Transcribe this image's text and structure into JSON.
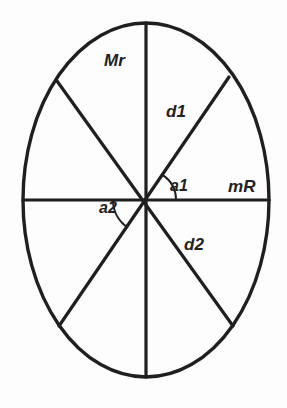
{
  "figure": {
    "background_color": "#fdfdfd",
    "stroke_color": "#1f1f1f",
    "label_color": "#222222"
  },
  "ellipse": {
    "center_x": 146,
    "center_y": 200,
    "radius_x": 123,
    "radius_y": 177,
    "stroke_width": 3
  },
  "labels": {
    "major_radius_vertical": "Mr",
    "diagonal_upper_right": "d1",
    "minor_radius_horizontal": "mR",
    "angle_upper": "a1",
    "angle_lower": "a2",
    "diagonal_lower_right": "d2"
  },
  "chart_data": {
    "type": "diagram",
    "shape": "ellipse",
    "center": [
      146,
      200
    ],
    "semi_axis_x": 123,
    "semi_axis_y": 177,
    "radii": [
      {
        "name": "Mr",
        "label": "Mr",
        "from": [
          146,
          200
        ],
        "to": [
          146,
          23
        ],
        "description": "vertical semi-major radius upward"
      },
      {
        "name": "Mr_down",
        "label": "",
        "from": [
          146,
          200
        ],
        "to": [
          146,
          377
        ],
        "description": "vertical semi-major radius downward"
      },
      {
        "name": "mR",
        "label": "mR",
        "from": [
          146,
          200
        ],
        "to": [
          269,
          200
        ],
        "description": "horizontal semi-minor radius rightward"
      },
      {
        "name": "mR_left",
        "label": "",
        "from": [
          146,
          200
        ],
        "to": [
          23,
          200
        ],
        "description": "horizontal semi-minor radius leftward"
      },
      {
        "name": "d1",
        "label": "d1",
        "from": [
          146,
          200
        ],
        "to": [
          229,
          77
        ],
        "description": "diagonal chord upper-right"
      },
      {
        "name": "d2",
        "label": "d2",
        "from": [
          146,
          200
        ],
        "to": [
          233,
          326
        ],
        "description": "diagonal chord lower-right"
      },
      {
        "name": "d1_opposite",
        "label": "",
        "from": [
          146,
          200
        ],
        "to": [
          59,
          326
        ],
        "description": "diagonal chord lower-left"
      },
      {
        "name": "d2_opposite",
        "label": "",
        "from": [
          146,
          200
        ],
        "to": [
          57,
          81
        ],
        "description": "diagonal chord upper-left"
      }
    ],
    "angles": [
      {
        "name": "a1",
        "label": "a1",
        "vertex": [
          146,
          200
        ],
        "between": [
          "mR",
          "d1"
        ],
        "approx_degrees": 56,
        "arc_radius": 30
      },
      {
        "name": "a2",
        "label": "a2",
        "vertex": [
          146,
          200
        ],
        "between": [
          "mR_left",
          "d1_opposite"
        ],
        "approx_degrees": 55,
        "arc_radius": 33
      }
    ],
    "sector_count": 8,
    "grid": false,
    "legend": false
  }
}
